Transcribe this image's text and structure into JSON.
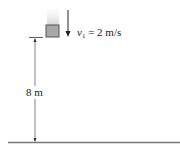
{
  "diagram": {
    "block": {
      "label": "block",
      "fill": "#a8a8a8",
      "stroke": "#555555"
    },
    "velocity": {
      "symbol": "v",
      "subscript": "1",
      "rest": " = 2 m/s"
    },
    "height_label": "8 m",
    "ground": {
      "color": "#777777"
    }
  }
}
